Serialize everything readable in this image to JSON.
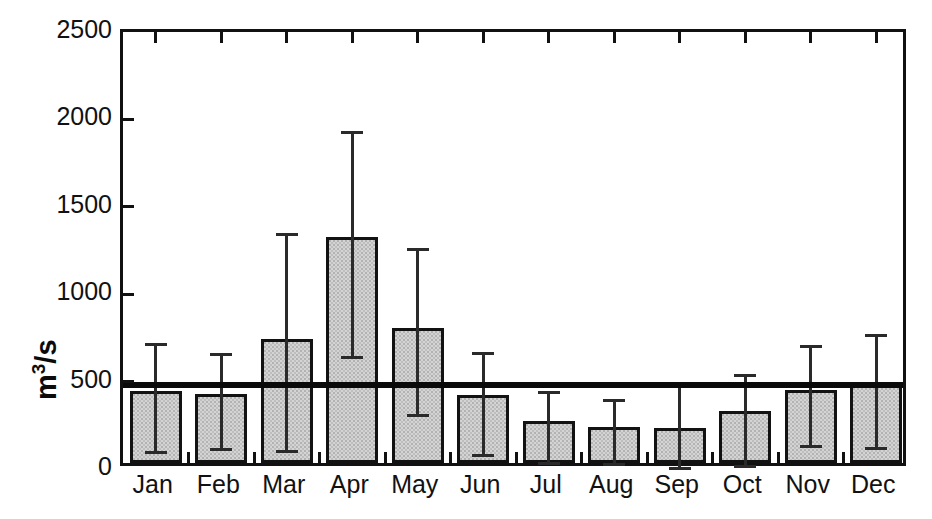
{
  "chart_data": {
    "type": "bar",
    "title": "",
    "subtitle": "",
    "xlabel": "",
    "ylabel": "m3/s",
    "ylabel_parts": {
      "base": "m",
      "exponent": "3",
      "suffix": "/s"
    },
    "categories": [
      "Jan",
      "Feb",
      "Mar",
      "Apr",
      "May",
      "Jun",
      "Jul",
      "Aug",
      "Sep",
      "Oct",
      "Nov",
      "Dec"
    ],
    "values": [
      410,
      395,
      710,
      1295,
      775,
      390,
      240,
      205,
      200,
      295,
      420,
      445
    ],
    "error_low": [
      95,
      110,
      100,
      640,
      305,
      80,
      30,
      25,
      5,
      15,
      130,
      115
    ],
    "error_high": [
      710,
      655,
      1340,
      1925,
      1255,
      660,
      440,
      390,
      490,
      535,
      700,
      765
    ],
    "yticks": [
      0,
      500,
      1000,
      1500,
      2000,
      2500
    ],
    "ytick_labels": [
      "0",
      "500",
      "1000",
      "1500",
      "2000",
      "2500"
    ],
    "ylim": [
      0,
      2500
    ],
    "grid": false,
    "legend": null,
    "annotations": [
      {
        "type": "hline",
        "name": "annual-mean-line",
        "value": 480,
        "label": ""
      }
    ],
    "colors": {
      "bar_fill": "#d4d4d4",
      "bar_edge": "#121212",
      "error_bar": "#2a2a2a",
      "axis": "#111111",
      "mean_line": "#0a0a0a",
      "background": "#ffffff"
    }
  }
}
